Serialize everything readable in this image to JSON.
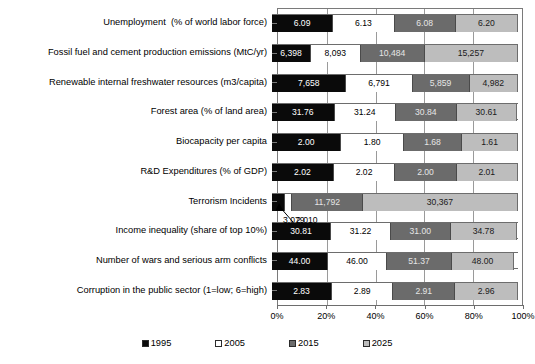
{
  "chart_data": {
    "type": "bar",
    "subtype": "100% stacked horizontal bar",
    "title": "",
    "xlabel": "",
    "ylabel": "",
    "grid": true,
    "legend_position": "bottom",
    "xlim": [
      0,
      100
    ],
    "xticks": [
      "0%",
      "20%",
      "40%",
      "60%",
      "80%",
      "100%"
    ],
    "series": [
      {
        "name": "1995",
        "color": "#0a0a0a"
      },
      {
        "name": "2005",
        "color": "#ffffff"
      },
      {
        "name": "2015",
        "color": "#6b6b6b"
      },
      {
        "name": "2025",
        "color": "#bdbdbd"
      }
    ],
    "categories": [
      "Unemployment  (% of world labor force)",
      "Fossil fuel and cement production emissions (MtC/yr)",
      "Renewable internal freshwater resources (m3/capita)",
      "Forest area (% of land area)",
      "Biocapacity per capita",
      "R&D Expenditures (% of GDP)",
      "Terrorism Incidents",
      "Income inequality (share of top 10%)",
      "Number of wars and serious arm conflicts",
      "Corruption in the public sector (1=low; 6=high)"
    ],
    "rows": [
      {
        "category": "Unemployment  (% of world labor force)",
        "values": [
          6.09,
          6.13,
          6.08,
          6.2
        ],
        "labels": [
          "6.09",
          "6.13",
          "6.08",
          "6.20"
        ],
        "percents": [
          24.86,
          25.02,
          24.82,
          25.31
        ]
      },
      {
        "category": "Fossil fuel and cement production emissions (MtC/yr)",
        "values": [
          6398,
          8093,
          10484,
          15257
        ],
        "labels": [
          "6,398",
          "8,093",
          "10,484",
          "15,257"
        ],
        "percents": [
          15.9,
          20.12,
          26.06,
          37.92
        ]
      },
      {
        "category": "Renewable internal freshwater resources (m3/capita)",
        "values": [
          7658,
          6791,
          5859,
          4982
        ],
        "labels": [
          "7,658",
          "6,791",
          "5,859",
          "4,982"
        ],
        "percents": [
          30.28,
          26.85,
          23.17,
          19.7
        ]
      },
      {
        "category": "Forest area (% of land area)",
        "values": [
          31.76,
          31.24,
          30.84,
          30.61
        ],
        "labels": [
          "31.76",
          "31.24",
          "30.84",
          "30.61"
        ],
        "percents": [
          25.41,
          25.0,
          24.68,
          24.5
        ]
      },
      {
        "category": "Biocapacity per capita",
        "values": [
          2.0,
          1.8,
          1.68,
          1.61
        ],
        "labels": [
          "2.00",
          "1.80",
          "1.68",
          "1.61"
        ],
        "percents": [
          28.53,
          25.68,
          23.96,
          22.97
        ]
      },
      {
        "category": "R&D Expenditures (% of GDP)",
        "values": [
          2.02,
          2.02,
          2.0,
          2.01
        ],
        "labels": [
          "2.02",
          "2.02",
          "2.00",
          "2.01"
        ],
        "percents": [
          25.12,
          25.12,
          24.88,
          25.0
        ]
      },
      {
        "category": "Terrorism Incidents",
        "values": [
          3079,
          2010,
          11792,
          30367
        ],
        "labels": [
          "",
          "",
          "11,792",
          "30,367"
        ],
        "percents": [
          5.3,
          3.0,
          28.7,
          63.0
        ],
        "annotation": {
          "left_value": "3,079",
          "right_value": "2,010"
        }
      },
      {
        "category": "Income inequality (share of top 10%)",
        "values": [
          30.81,
          31.22,
          31.0,
          34.78
        ],
        "labels": [
          "30.81",
          "31.22",
          "31.00",
          "34.78"
        ],
        "percents": [
          24.04,
          24.36,
          24.19,
          27.14
        ]
      },
      {
        "category": "Number of wars and serious arm conflicts",
        "values": [
          44.0,
          46.0,
          51.37,
          48.0
        ],
        "labels": [
          "44.00",
          "46.00",
          "51.37",
          "48.00"
        ],
        "percents": [
          22.82,
          23.86,
          26.64,
          24.9
        ]
      },
      {
        "category": "Corruption in the public sector (1=low; 6=high)",
        "values": [
          2.83,
          2.89,
          2.91,
          2.96
        ],
        "labels": [
          "2.83",
          "2.89",
          "2.91",
          "2.96"
        ],
        "percents": [
          24.44,
          24.96,
          25.13,
          25.56
        ]
      }
    ]
  },
  "axis": {
    "ticks": [
      {
        "label": "0%",
        "percent": 0
      },
      {
        "label": "20%",
        "percent": 20
      },
      {
        "label": "40%",
        "percent": 40
      },
      {
        "label": "60%",
        "percent": 60
      },
      {
        "label": "80%",
        "percent": 80
      },
      {
        "label": "100%",
        "percent": 100
      }
    ]
  },
  "legend": {
    "items": [
      {
        "label": "1995",
        "key": "c1995"
      },
      {
        "label": "2005",
        "key": "c2005"
      },
      {
        "label": "2015",
        "key": "c2015"
      },
      {
        "label": "2025",
        "key": "c2025"
      }
    ]
  }
}
